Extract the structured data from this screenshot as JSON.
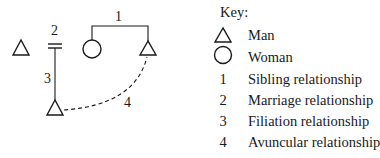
{
  "diagram": {
    "nodes": [
      {
        "id": "man-1",
        "type": "man"
      },
      {
        "id": "woman-1",
        "type": "woman"
      },
      {
        "id": "man-2",
        "type": "man"
      },
      {
        "id": "man-3",
        "type": "man"
      }
    ],
    "edge_labels": {
      "sibling": "1",
      "marriage": "2",
      "filiation": "3",
      "avuncular": "4"
    },
    "colors": {
      "stroke": "#1a1a1a",
      "background": "#ffffff"
    }
  },
  "key": {
    "title": "Key:",
    "items": [
      {
        "symbol": "triangle",
        "label": "Man"
      },
      {
        "symbol": "circle",
        "label": "Woman"
      },
      {
        "symbol": "1",
        "label": "Sibling relationship"
      },
      {
        "symbol": "2",
        "label": "Marriage relationship"
      },
      {
        "symbol": "3",
        "label": "Filiation relationship"
      },
      {
        "symbol": "4",
        "label": "Avuncular relationship"
      }
    ]
  }
}
